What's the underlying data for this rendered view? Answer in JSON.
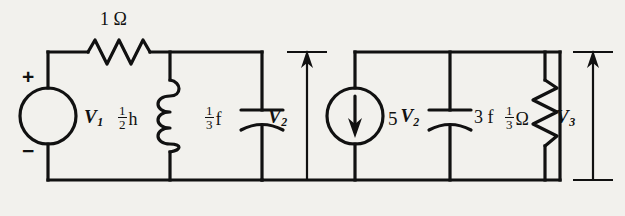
{
  "figure": {
    "kind": "electrical-circuit-schematic",
    "background_color": "#f2f1ed",
    "ink_color": "#111111",
    "width": 625,
    "height": 216
  },
  "labels": {
    "resistor_series": {
      "value": "1",
      "unit": "Ω",
      "full": "1 Ω"
    },
    "source_v1": "V",
    "source_v1_sub": "1",
    "polarity_plus": "+",
    "polarity_minus": "−",
    "inductor": {
      "numerator": "1",
      "denominator": "2",
      "unit": "h",
      "full": "1/2 h"
    },
    "capacitor_left": {
      "numerator": "1",
      "denominator": "3",
      "unit": "f",
      "full": "1/3 f"
    },
    "voltage_v2": "V",
    "voltage_v2_sub": "2",
    "dependent_source": {
      "coefficient": "5",
      "variable": "V",
      "subscript": "2",
      "full": "5 V2"
    },
    "capacitor_right": {
      "value": "3",
      "unit": "f",
      "full": "3 f"
    },
    "resistor_shunt": {
      "numerator": "1",
      "denominator": "3",
      "unit": "Ω",
      "full": "1/3 Ω"
    },
    "voltage_v3": "V",
    "voltage_v3_sub": "3"
  },
  "components": [
    {
      "name": "voltage-source-v1",
      "type": "independent-voltage-source",
      "label": "V1"
    },
    {
      "name": "resistor-1-ohm",
      "type": "resistor",
      "label": "1 Ω"
    },
    {
      "name": "inductor-half-henry",
      "type": "inductor",
      "label": "1/2 h"
    },
    {
      "name": "capacitor-one-third-farad",
      "type": "capacitor",
      "label": "1/3 f"
    },
    {
      "name": "current-source-5v2",
      "type": "dependent-current-source",
      "label": "5 V2"
    },
    {
      "name": "capacitor-3-farad",
      "type": "capacitor",
      "label": "3 f"
    },
    {
      "name": "resistor-one-third-ohm",
      "type": "resistor",
      "label": "1/3 Ω"
    }
  ],
  "measurements": [
    {
      "name": "voltage-marker-v2",
      "label": "V2",
      "direction": "up"
    },
    {
      "name": "voltage-marker-v3",
      "label": "V3",
      "direction": "up"
    }
  ]
}
